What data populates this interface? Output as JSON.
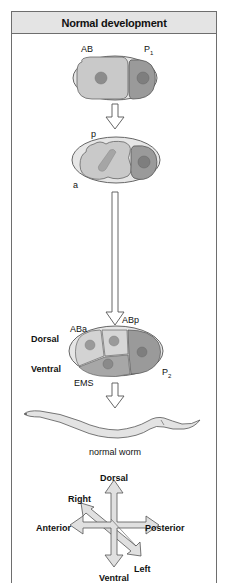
{
  "title": "Normal development",
  "stage1": {
    "labels": {
      "anterior_cell": "AB",
      "posterior_cell": "P",
      "posterior_sub": "1"
    }
  },
  "stage2": {
    "labels": {
      "top": "p",
      "bottom": "a"
    }
  },
  "stage3": {
    "labels": {
      "aba": "ABa",
      "abp": "ABp",
      "ems": "EMS",
      "p2": "P",
      "p2_sub": "2",
      "dorsal": "Dorsal",
      "ventral": "Ventral"
    }
  },
  "worm": {
    "caption": "normal worm"
  },
  "axes": {
    "dorsal": "Dorsal",
    "ventral": "Ventral",
    "anterior": "Anterior",
    "posterior": "Posterior",
    "right": "Right",
    "left": "Left"
  },
  "colors": {
    "eggshell": "#e6e6e6",
    "ab_cell": "#c9c9c9",
    "p_cell": "#9a9a9a",
    "nucleus": "#8c8c8c",
    "outline": "#555555",
    "arrow_fill": "#e0e0e0",
    "header_bg": "#e4e4e4"
  }
}
